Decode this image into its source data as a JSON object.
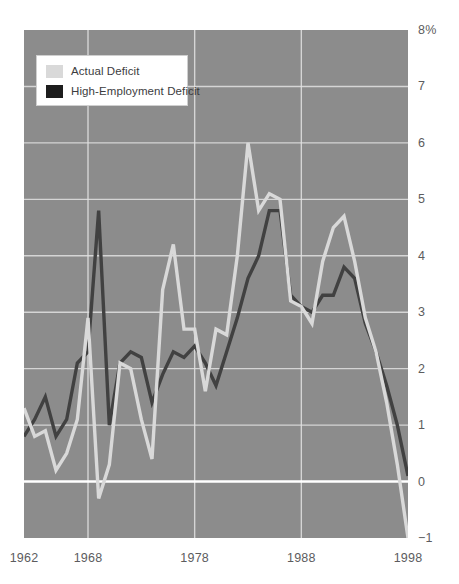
{
  "chart_data": {
    "type": "line",
    "title": "",
    "subtitle": "",
    "xlabel": "",
    "ylabel": "",
    "grid": true,
    "legend_position": "top-left",
    "xlim": [
      1962,
      1998
    ],
    "ylim": [
      -1,
      8
    ],
    "x_ticks": [
      "1962",
      "1968",
      "1978",
      "1988",
      "1998"
    ],
    "x_tick_values": [
      1962,
      1968,
      1978,
      1988,
      1998
    ],
    "y_ticks": [
      "8%",
      "7",
      "6",
      "5",
      "4",
      "3",
      "2",
      "1",
      "0",
      "-1"
    ],
    "y_tick_values": [
      8,
      7,
      6,
      5,
      4,
      3,
      2,
      1,
      0,
      -1
    ],
    "zero_line": 0,
    "colors": {
      "plot_background": "#8c8c8c",
      "gridline": "#e2e2e2",
      "zero_line": "#ffffff",
      "actual_deficit": "#d9d9d9",
      "high_employment_deficit": "#414141",
      "page_background": "#ffffff",
      "tick_label": "#5c5c5e"
    },
    "x": [
      1962,
      1963,
      1964,
      1965,
      1966,
      1967,
      1968,
      1969,
      1970,
      1971,
      1972,
      1973,
      1974,
      1975,
      1976,
      1977,
      1978,
      1979,
      1980,
      1981,
      1982,
      1983,
      1984,
      1985,
      1986,
      1987,
      1988,
      1989,
      1990,
      1991,
      1992,
      1993,
      1994,
      1995,
      1996,
      1997,
      1998
    ],
    "series": [
      {
        "name": "Actual Deficit",
        "color": "#d9d9d9",
        "values": [
          1.3,
          0.8,
          0.9,
          0.2,
          0.5,
          1.1,
          2.9,
          -0.3,
          0.3,
          2.1,
          2.0,
          1.1,
          0.4,
          3.4,
          4.2,
          2.7,
          2.7,
          1.6,
          2.7,
          2.6,
          4.0,
          6.0,
          4.8,
          5.1,
          5.0,
          3.2,
          3.1,
          2.8,
          3.9,
          4.5,
          4.7,
          3.9,
          2.9,
          2.3,
          1.4,
          0.3,
          -1.0
        ]
      },
      {
        "name": "High-Employment Deficit",
        "color": "#414141",
        "values": [
          0.8,
          1.1,
          1.5,
          0.8,
          1.1,
          2.1,
          2.3,
          4.8,
          1.0,
          2.1,
          2.3,
          2.2,
          1.4,
          1.9,
          2.3,
          2.2,
          2.4,
          2.1,
          1.7,
          2.3,
          2.9,
          3.6,
          4.0,
          4.8,
          4.8,
          3.3,
          3.1,
          3.0,
          3.3,
          3.3,
          3.8,
          3.6,
          2.8,
          2.3,
          1.7,
          1.0,
          0.1
        ]
      }
    ]
  },
  "legend": {
    "items": [
      {
        "label": "Actual Deficit",
        "color": "#d9d9d9"
      },
      {
        "label": "High-Employment Deficit",
        "color": "#1d1d1d"
      }
    ]
  },
  "axis": {
    "y_labels": [
      "8%",
      "7",
      "6",
      "5",
      "4",
      "3",
      "2",
      "1",
      "0",
      "−1"
    ],
    "x_labels": [
      "1962",
      "1968",
      "1978",
      "1988",
      "1998"
    ]
  }
}
